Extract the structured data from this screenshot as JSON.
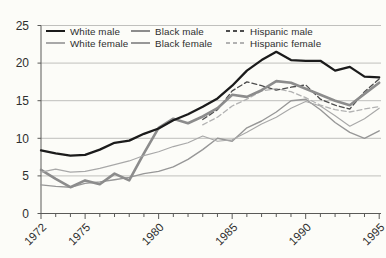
{
  "chart_data": {
    "type": "line",
    "title": "",
    "xlabel": "",
    "ylabel": "",
    "x_range": [
      1972,
      1995
    ],
    "x": [
      1972,
      1973,
      1974,
      1975,
      1976,
      1977,
      1978,
      1979,
      1980,
      1981,
      1982,
      1983,
      1984,
      1985,
      1986,
      1987,
      1988,
      1989,
      1990,
      1991,
      1992,
      1993,
      1994,
      1995
    ],
    "x_labeled_ticks": [
      1972,
      1975,
      1980,
      1985,
      1990,
      1995
    ],
    "x_tick_labels": [
      "1972",
      "1975",
      "1980",
      "1985",
      "1990",
      "1995"
    ],
    "x_minor_ticks_every_year": true,
    "ylim": [
      0,
      25
    ],
    "y_ticks": [
      0,
      5,
      10,
      15,
      20,
      25
    ],
    "y_tick_labels": [
      "0",
      "5",
      "10",
      "15",
      "20",
      "25"
    ],
    "grid": true,
    "legend_position": "top-inside",
    "series": [
      {
        "name": "White male",
        "color": "#1b1b1b",
        "stroke_width": 2.3,
        "dashed": false,
        "values": [
          8.4,
          8.0,
          7.7,
          7.8,
          8.5,
          9.4,
          9.7,
          10.6,
          11.3,
          12.4,
          13.2,
          14.2,
          15.3,
          17.0,
          19.0,
          20.4,
          21.5,
          20.4,
          20.3,
          20.3,
          19.0,
          19.5,
          18.2,
          18.1
        ]
      },
      {
        "name": "White female",
        "color": "#a8a8a8",
        "stroke_width": 1.1,
        "dashed": false,
        "values": [
          5.5,
          5.9,
          5.5,
          5.6,
          6.0,
          6.5,
          7.0,
          7.7,
          8.2,
          8.9,
          9.4,
          10.3,
          9.6,
          9.8,
          10.8,
          11.9,
          12.8,
          14.0,
          14.9,
          14.3,
          13.0,
          11.6,
          12.6,
          14.0
        ]
      },
      {
        "name": "Black male",
        "color": "#8c8c8c",
        "stroke_width": 2.6,
        "dashed": false,
        "values": [
          5.8,
          4.6,
          3.5,
          4.4,
          3.9,
          5.3,
          4.4,
          8.0,
          11.4,
          12.6,
          12.0,
          12.9,
          14.0,
          15.8,
          15.5,
          16.4,
          17.6,
          17.4,
          16.6,
          15.8,
          15.0,
          14.4,
          15.9,
          17.4
        ]
      },
      {
        "name": "Black female",
        "color": "#979797",
        "stroke_width": 1.4,
        "dashed": false,
        "values": [
          3.8,
          3.6,
          3.5,
          4.0,
          4.2,
          4.5,
          4.8,
          5.3,
          5.6,
          6.2,
          7.2,
          8.5,
          10.0,
          9.6,
          11.4,
          12.3,
          13.5,
          15.0,
          15.2,
          13.8,
          12.1,
          10.8,
          10.0,
          11.0
        ]
      },
      {
        "name": "Hispanic male",
        "color": "#4d4d4d",
        "stroke_width": 1.3,
        "dashed": true,
        "values": [
          null,
          null,
          null,
          null,
          null,
          null,
          null,
          null,
          null,
          null,
          null,
          12.5,
          13.8,
          16.3,
          17.5,
          17.0,
          16.4,
          16.8,
          17.1,
          15.2,
          14.4,
          13.9,
          16.2,
          17.9
        ]
      },
      {
        "name": "Hispanic female",
        "color": "#b2b2b2",
        "stroke_width": 1.3,
        "dashed": true,
        "values": [
          null,
          null,
          null,
          null,
          null,
          null,
          null,
          null,
          null,
          null,
          null,
          11.8,
          12.8,
          14.3,
          15.2,
          16.3,
          16.6,
          16.2,
          15.4,
          14.4,
          13.8,
          13.5,
          13.9,
          14.2
        ]
      }
    ],
    "colors": {
      "background": "#fcfcf8",
      "gridline": "#b9b9b5",
      "axis": "#5a5a58",
      "tick_label": "#2e2e2e"
    }
  }
}
